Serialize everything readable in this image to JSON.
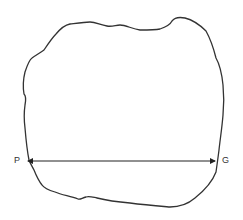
{
  "diagram": {
    "shape": "irregular-closed-outline",
    "measurement": {
      "type": "double-headed-arrow",
      "start_label": "P",
      "end_label": "G"
    },
    "colors": {
      "stroke": "#333333",
      "background": "#ffffff"
    }
  }
}
